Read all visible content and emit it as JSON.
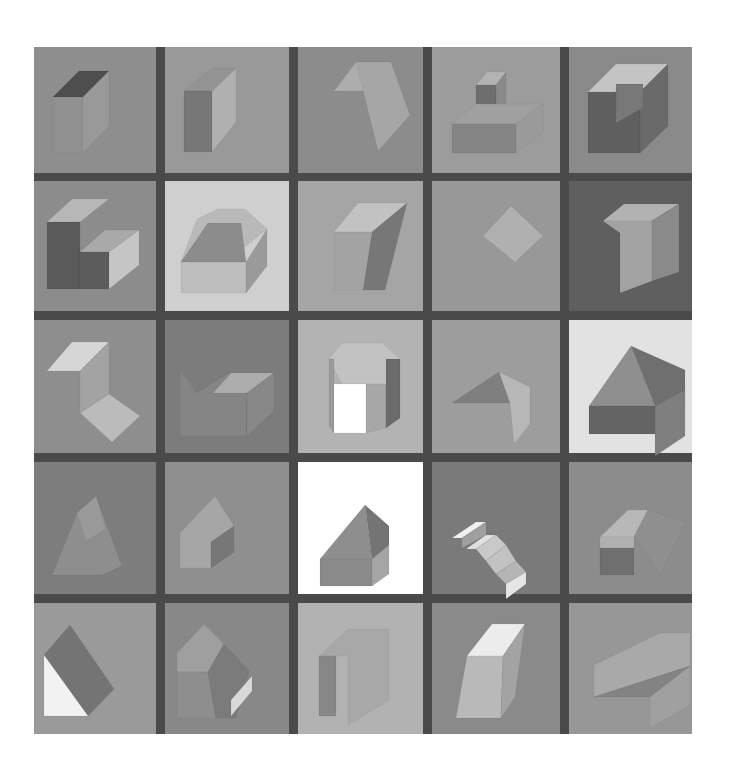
{
  "artwork": {
    "frame": {
      "x": 34,
      "y": 47,
      "w": 658,
      "h": 687,
      "color": "#4a4a4a"
    },
    "columns": [
      [
        34,
        156
      ],
      [
        165,
        289
      ],
      [
        298,
        423
      ],
      [
        432,
        560
      ],
      [
        569,
        692
      ]
    ],
    "rows": [
      [
        47,
        173
      ],
      [
        181,
        311
      ],
      [
        320,
        453
      ],
      [
        462,
        594
      ],
      [
        603,
        734
      ]
    ],
    "cells": [
      {
        "r": 0,
        "c": 0,
        "bg": "#8e8e8e",
        "shapes": [
          {
            "pts": "53,97 79,71 109,71 83,97",
            "fill": "#4e4e4e"
          },
          {
            "pts": "53,97 83,97 83,153 53,153",
            "fill": "#909090"
          },
          {
            "pts": "83,97 109,71 109,126 83,153",
            "fill": "#999999"
          }
        ]
      },
      {
        "r": 0,
        "c": 1,
        "bg": "#999999",
        "shapes": [
          {
            "pts": "184,91 212,91 212,152 184,152",
            "fill": "#777777"
          },
          {
            "pts": "212,91 236,68 236,122 212,152",
            "fill": "#b0b0b0"
          },
          {
            "pts": "184,91 212,68 236,68 212,91",
            "fill": "#939393"
          }
        ]
      },
      {
        "r": 0,
        "c": 2,
        "bg": "#8c8c8c",
        "shapes": [
          {
            "pts": "334,91 356,62 391,62 366,91",
            "fill": "#adadad"
          },
          {
            "pts": "356,62 391,62 410,115 378,151",
            "fill": "#a6a6a6"
          }
        ]
      },
      {
        "r": 0,
        "c": 3,
        "bg": "#9c9c9c",
        "shapes": [
          {
            "pts": "476,85 487,72 506,72 496,85",
            "fill": "#b3b3b3"
          },
          {
            "pts": "476,85 496,85 496,114 476,114",
            "fill": "#6e6e6e"
          },
          {
            "pts": "496,85 506,72 506,104 496,114",
            "fill": "#8a8a8a"
          },
          {
            "pts": "452,124 476,104 543,104 516,124",
            "fill": "#a0a0a0"
          },
          {
            "pts": "452,124 516,124 516,153 452,153",
            "fill": "#858585"
          },
          {
            "pts": "516,124 543,104 543,132 516,153",
            "fill": "#9a9a9a"
          }
        ]
      },
      {
        "r": 0,
        "c": 4,
        "bg": "#8a8a8a",
        "shapes": [
          {
            "pts": "588,92 616,64 668,64 640,92",
            "fill": "#c4c4c4"
          },
          {
            "pts": "588,92 640,92 640,153 588,153",
            "fill": "#5f5f5f"
          },
          {
            "pts": "640,92 668,64 668,126 640,153",
            "fill": "#6a6a6a"
          },
          {
            "pts": "616,84 643,84 643,108 616,123",
            "fill": "#787878"
          }
        ]
      },
      {
        "r": 1,
        "c": 0,
        "bg": "#8c8c8c",
        "shapes": [
          {
            "pts": "47,222 72,199 109,199 80,222",
            "fill": "#b7b7b7"
          },
          {
            "pts": "47,222 80,222 80,289 47,289",
            "fill": "#5a5a5a"
          },
          {
            "pts": "80,252 105,230 139,230 109,252",
            "fill": "#a9a9a9"
          },
          {
            "pts": "80,252 109,252 109,289 80,289",
            "fill": "#5c5c5c"
          },
          {
            "pts": "109,252 139,230 139,265 109,289",
            "fill": "#c5c5c5"
          }
        ]
      },
      {
        "r": 1,
        "c": 1,
        "bg": "#cfcfcf",
        "shapes": [
          {
            "pts": "197,219 218,209 245,209 267,229 245,247 181,262",
            "fill": "#b9b9b9"
          },
          {
            "pts": "181,262 208,223 241,223 246,262",
            "fill": "#8c8c8c"
          },
          {
            "pts": "181,262 246,262 246,293 181,293",
            "fill": "#bdbdbd"
          },
          {
            "pts": "246,262 267,229 267,266 246,293",
            "fill": "#9a9a9a"
          }
        ]
      },
      {
        "r": 1,
        "c": 2,
        "bg": "#a5a5a5",
        "shapes": [
          {
            "pts": "334,232 358,203 407,203 372,232",
            "fill": "#c2c2c2"
          },
          {
            "pts": "372,232 407,203 385,290 363,290",
            "fill": "#777777"
          },
          {
            "pts": "334,232 372,232 363,290 334,290",
            "fill": "#a3a3a3"
          }
        ]
      },
      {
        "r": 1,
        "c": 3,
        "bg": "#989898",
        "shapes": [
          {
            "pts": "483,236 511,206 543,236 515,262",
            "fill": "#b0b0b0"
          }
        ]
      },
      {
        "r": 1,
        "c": 4,
        "bg": "#5f5f5f",
        "shapes": [
          {
            "pts": "603,221 624,204 679,204 652,221",
            "fill": "#b2b2b2"
          },
          {
            "pts": "603,221 620,233 620,293 652,281 652,221",
            "fill": "#a3a3a3"
          },
          {
            "pts": "652,221 679,204 679,272 652,281",
            "fill": "#8a8a8a"
          }
        ]
      },
      {
        "r": 2,
        "c": 0,
        "bg": "#8e8e8e",
        "shapes": [
          {
            "pts": "47,371 72,342 109,342 80,371",
            "fill": "#d6d6d6"
          },
          {
            "pts": "80,371 109,342 109,394 80,413",
            "fill": "#a3a3a3"
          },
          {
            "pts": "80,413 109,394 140,416 112,442",
            "fill": "#bbbbbb"
          }
        ]
      },
      {
        "r": 2,
        "c": 1,
        "bg": "#7c7c7c",
        "shapes": [
          {
            "pts": "180,369 197,393 228,373 247,393 246,436 180,436",
            "fill": "#858585"
          },
          {
            "pts": "213,393 231,373 274,373 247,393",
            "fill": "#adadad"
          },
          {
            "pts": "247,393 274,373 274,411 247,436",
            "fill": "#888888"
          }
        ]
      },
      {
        "r": 2,
        "c": 2,
        "bg": "#b3b3b3",
        "shapes": [
          {
            "pts": "329,359 342,343 382,343 400,359 386,384 342,384",
            "fill": "#c2c2c2"
          },
          {
            "pts": "329,359 334,359 334,433 329,426",
            "fill": "#9a9a9a"
          },
          {
            "pts": "334,384 366,384 366,433 334,433",
            "fill": "#ffffff"
          },
          {
            "pts": "366,384 386,384 386,428 366,433",
            "fill": "#a7a7a7"
          },
          {
            "pts": "386,359 400,359 400,418 386,428",
            "fill": "#6b6b6b"
          }
        ]
      },
      {
        "r": 2,
        "c": 3,
        "bg": "#9d9d9d",
        "shapes": [
          {
            "pts": "452,403 499,372 510,403",
            "fill": "#7f7f7f"
          },
          {
            "pts": "499,372 530,387 530,424 514,444 510,403",
            "fill": "#b7b7b7"
          }
        ]
      },
      {
        "r": 2,
        "c": 4,
        "bg": "#e2e2e2",
        "shapes": [
          {
            "pts": "589,406 631,346 655,406",
            "fill": "#8f8f8f"
          },
          {
            "pts": "631,346 685,370 685,406 655,406",
            "fill": "#6f6f6f"
          },
          {
            "pts": "655,406 685,390 685,436 655,456",
            "fill": "#7f7f7f"
          },
          {
            "pts": "589,406 655,406 655,434 589,434",
            "fill": "#646464"
          }
        ]
      },
      {
        "r": 3,
        "c": 0,
        "bg": "#7d7d7d",
        "shapes": [
          {
            "pts": "52,575 77,513 96,496 122,566 102,575",
            "fill": "#8e8e8e"
          },
          {
            "pts": "77,513 96,496 106,529 86,541",
            "fill": "#9a9a9a"
          }
        ]
      },
      {
        "r": 3,
        "c": 1,
        "bg": "#8f8f8f",
        "shapes": [
          {
            "pts": "180,568 180,533 215,496 234,526 211,542 211,568",
            "fill": "#a6a6a6"
          },
          {
            "pts": "211,542 234,526 234,552 211,568",
            "fill": "#777777"
          }
        ]
      },
      {
        "r": 3,
        "c": 2,
        "bg": "#ffffff",
        "shapes": [
          {
            "pts": "320,559 365,505 372,559",
            "fill": "#8e8e8e"
          },
          {
            "pts": "365,505 389,526 389,556 372,559",
            "fill": "#747474"
          },
          {
            "pts": "372,559 389,545 389,574 372,586",
            "fill": "#a5a5a5"
          },
          {
            "pts": "320,559 372,559 372,586 320,586",
            "fill": "#8a8a8a"
          }
        ]
      },
      {
        "r": 3,
        "c": 3,
        "bg": "#7a7a7a",
        "shapes": [
          {
            "pts": "452,538 476,522 486,522 462,538",
            "fill": "#f0f0f0"
          },
          {
            "pts": "462,538 486,522 486,535 462,548",
            "fill": "#a0a0a0"
          },
          {
            "pts": "466,549 486,535 496,535 476,549",
            "fill": "#e0e0e0"
          },
          {
            "pts": "476,549 496,535 506,545 486,561",
            "fill": "#c9c9c9"
          },
          {
            "pts": "486,561 506,545 516,561 496,574",
            "fill": "#c2c2c2"
          },
          {
            "pts": "496,574 516,561 526,572 506,584",
            "fill": "#b5b5b5"
          },
          {
            "pts": "506,584 526,572 526,584 506,599",
            "fill": "#e6e6e6"
          }
        ]
      },
      {
        "r": 3,
        "c": 4,
        "bg": "#8c8c8c",
        "shapes": [
          {
            "pts": "600,537 628,510 648,510 634,537",
            "fill": "#b8b8b8"
          },
          {
            "pts": "648,510 686,522 660,575 634,537",
            "fill": "#8f8f8f"
          },
          {
            "pts": "600,548 634,548 634,575 600,575",
            "fill": "#6f6f6f"
          },
          {
            "pts": "600,537 634,537 634,548 600,548",
            "fill": "#b0b0b0"
          }
        ]
      },
      {
        "r": 4,
        "c": 0,
        "bg": "#9a9a9a",
        "shapes": [
          {
            "pts": "44,655 70,625 114,689 88,716",
            "fill": "#747474"
          },
          {
            "pts": "44,655 88,716 44,716",
            "fill": "#f2f2f2"
          }
        ]
      },
      {
        "r": 4,
        "c": 1,
        "bg": "#888888",
        "shapes": [
          {
            "pts": "177,653 204,624 224,644 208,672 177,672",
            "fill": "#9f9f9f"
          },
          {
            "pts": "177,672 208,672 216,718 177,718",
            "fill": "#8e8e8e"
          },
          {
            "pts": "208,672 224,644 249,671 236,718 216,718",
            "fill": "#7b7b7b"
          },
          {
            "pts": "231,700 252,676 252,691 231,716",
            "fill": "#d9d9d9"
          }
        ]
      },
      {
        "r": 4,
        "c": 2,
        "bg": "#b2b2b2",
        "shapes": [
          {
            "pts": "319,656 348,629 389,629 389,700 348,725 348,656",
            "fill": "#a8a8a8"
          },
          {
            "pts": "319,656 336,656 336,716 319,716",
            "fill": "#878787"
          }
        ]
      },
      {
        "r": 4,
        "c": 3,
        "bg": "#8a8a8a",
        "shapes": [
          {
            "pts": "467,656 492,624 525,624 503,656",
            "fill": "#ececec"
          },
          {
            "pts": "467,656 503,656 501,718 456,718",
            "fill": "#b9b9b9"
          },
          {
            "pts": "503,656 525,624 515,697 501,718",
            "fill": "#a3a3a3"
          }
        ]
      },
      {
        "r": 4,
        "c": 4,
        "bg": "#979797",
        "shapes": [
          {
            "pts": "594,665 660,633 690,633 690,666 594,697",
            "fill": "#a9a9a9"
          },
          {
            "pts": "594,697 690,666 650,697",
            "fill": "#838383"
          },
          {
            "pts": "650,697 690,666 690,705 650,728",
            "fill": "#a0a0a0"
          }
        ]
      }
    ]
  }
}
